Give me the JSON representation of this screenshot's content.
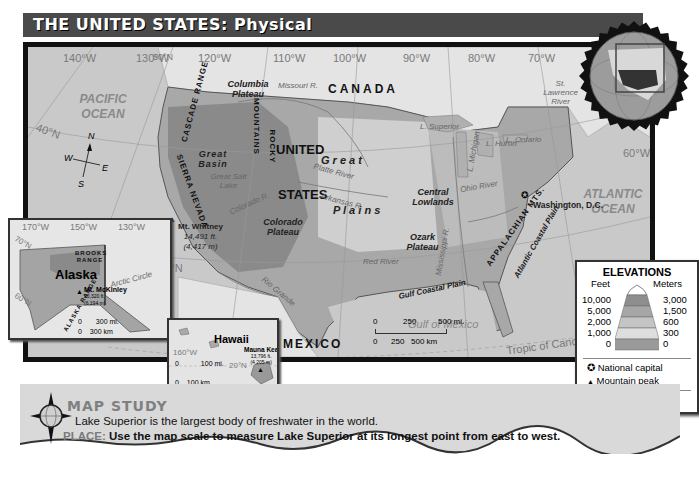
{
  "title": "THE UNITED STATES: Physical",
  "map": {
    "longitudes": [
      "140°W",
      "130°W",
      "120°W",
      "110°W",
      "100°W",
      "90°W",
      "80°W",
      "70°W",
      "60°W"
    ],
    "latitudes": [
      "50°N",
      "40°N",
      "30°N"
    ],
    "oceans": {
      "pacific": "PACIFIC OCEAN",
      "atlantic": "ATLANTIC OCEAN",
      "gulf": "Gulf of Mexico"
    },
    "countries": {
      "canada": "CANADA",
      "mexico": "MEXICO",
      "us_line1": "UNITED",
      "us_line2": "STATES"
    },
    "regions": {
      "columbia": "Columbia Plateau",
      "great_basin": "Great Basin",
      "colorado_plateau": "Colorado Plateau",
      "central_lowlands": "Central Lowlands",
      "ozark": "Ozark Plateau",
      "great_plains_1": "G r e a t",
      "great_plains_2": "P l a i n s",
      "gulf_coastal": "Gulf Coastal Plain",
      "atlantic_coastal": "Atlantic Coastal Plain"
    },
    "ranges": {
      "cascade": "CASCADE RANGE",
      "sierra": "SIERRA NEVADA",
      "rocky_1": "ROCKY",
      "rocky_2": "MOUNTAINS",
      "appalachian": "APPALACHIAN MTS."
    },
    "waters": {
      "missouri": "Missouri R.",
      "platte": "Platte River",
      "colorado": "Colorado R.",
      "arkansas": "Arkansas R.",
      "red": "Red River",
      "rio_grande": "Rio Grande",
      "mississippi": "Mississippi R.",
      "ohio": "Ohio River",
      "st_lawrence": "St. Lawrence River",
      "great_salt_lake": "Great Salt Lake",
      "superior": "L. Superior",
      "michigan": "L. Michigan",
      "huron": "L. Huron",
      "ontario": "L. Ontario",
      "erie": "L. Erie"
    },
    "peaks": {
      "whitney_name": "Mt. Whitney",
      "whitney_ft": "14,491 ft.",
      "whitney_m": "(4,417 m)"
    },
    "capital": "Washington, D.C.",
    "tropic": "Tropic of Cancer",
    "compass": {
      "n": "N",
      "s": "S",
      "e": "E",
      "w": "W"
    },
    "scale": {
      "mi_0": "0",
      "mi_250": "250",
      "mi_500": "500 mi.",
      "km_0": "0",
      "km_250": "250",
      "km_500": "500 km"
    }
  },
  "alaska_inset": {
    "name": "Alaska",
    "longitudes": [
      "170°W",
      "150°W",
      "130°W"
    ],
    "latitudes": [
      "70°N",
      "60°N"
    ],
    "brooks": "BROOKS RANGE",
    "alaska_range": "ALASKA RANGE",
    "arctic_circle": "Arctic Circle",
    "peak_name": "Mt. McKinley",
    "peak_ft": "20,320 ft.",
    "peak_m": "(6,194 m)",
    "scale_mi": "300 mi.",
    "scale_km": "300 km",
    "scale_0": "0"
  },
  "hawaii_inset": {
    "name": "Hawaii",
    "longitude": "160°W",
    "latitude": "20°N",
    "peak_name": "Mauna Kea",
    "peak_ft": "13,796 ft.",
    "peak_m": "(4,205 m)",
    "scale_mi": "100 mi.",
    "scale_km": "100 km",
    "scale_0": "0"
  },
  "legend": {
    "title": "ELEVATIONS",
    "feet_header": "Feet",
    "meters_header": "Meters",
    "levels": [
      {
        "feet": "10,000",
        "meters": "3,000",
        "color": "#8e8e8e"
      },
      {
        "feet": "5,000",
        "meters": "1,500",
        "color": "#a6a6a6"
      },
      {
        "feet": "2,000",
        "meters": "600",
        "color": "#c4c4c4"
      },
      {
        "feet": "1,000",
        "meters": "300",
        "color": "#dedede"
      },
      {
        "feet": "0",
        "meters": "0",
        "color": "#9a9a9a"
      }
    ],
    "capital_label": "National capital",
    "peak_label": "Mountain peak",
    "projection": "Lambert Equal-Area projection"
  },
  "map_study": {
    "heading": "MAP STUDY",
    "fact": "Lake Superior is the largest body of freshwater in the world.",
    "place_label": "PLACE:",
    "question": "Use the map scale to measure Lake Superior at its longest point from east to west."
  }
}
